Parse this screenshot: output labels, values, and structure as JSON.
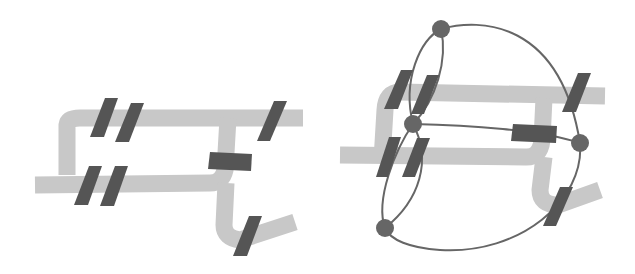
{
  "figure": {
    "panels": [
      {
        "id": "left",
        "description": "Road network with road segments (bridges/crossings) marked",
        "road_color": "#c8c8c8",
        "segment_color": "#555555",
        "roads": [
          "M67,175 L67,125 Q68,118 80,118 L303,118",
          "M35,185 L210,183 Q222,183 225,170 L228,118",
          "M226,183 L224,225 Q224,238 240,240 L295,222"
        ],
        "segments": [
          {
            "name": "seg-top-left-1",
            "points": "105,98 118,98 104,137 90,137"
          },
          {
            "name": "seg-top-left-2",
            "points": "131,103 144,103 129,142 115,142"
          },
          {
            "name": "seg-bot-left-1",
            "points": "89,166 102,166 88,205 74,205"
          },
          {
            "name": "seg-bot-left-2",
            "points": "115,166 128,166 114,206 100,206"
          },
          {
            "name": "seg-top-right",
            "points": "274,101 287,101 270,141 257,141"
          },
          {
            "name": "seg-middle",
            "points": "210,152 252,154 251,171 208,169"
          },
          {
            "name": "seg-bottom-right",
            "points": "249,216 262,216 247,256 233,256"
          }
        ]
      },
      {
        "id": "right",
        "description": "Same road network overlaid with a dual graph: nodes connected by edges through road segments",
        "road_color": "#c8c8c8",
        "segment_color": "#555555",
        "node_color": "#666666",
        "edge_color": "#666666",
        "roads": [
          "M382,160 L385,110 Q386,92 400,92 L605,96",
          "M340,155 L525,157 Q540,158 542,140 L544,98",
          "M544,157 L540,190 Q540,205 558,205 L600,190"
        ],
        "segments": [
          {
            "name": "seg-top-left-1",
            "points": "401,70 413,70 398,109 384,109"
          },
          {
            "name": "seg-top-left-2",
            "points": "427,75 439,75 424,114 411,114"
          },
          {
            "name": "seg-bot-left-1",
            "points": "389,137 401,137 388,177 376,177"
          },
          {
            "name": "seg-bot-left-2",
            "points": "417,138 430,138 415,177 402,177"
          },
          {
            "name": "seg-top-right",
            "points": "578,73 591,73 576,112 562,112"
          },
          {
            "name": "seg-middle",
            "points": "513,124 557,126 556,143 511,141"
          },
          {
            "name": "seg-bottom-right",
            "points": "560,187 573,187 556,226 543,226"
          }
        ],
        "nodes": [
          {
            "name": "node-top",
            "cx": 441,
            "cy": 29,
            "r": 9
          },
          {
            "name": "node-center-left",
            "cx": 413,
            "cy": 124,
            "r": 9
          },
          {
            "name": "node-right",
            "cx": 580,
            "cy": 143,
            "r": 9
          },
          {
            "name": "node-bottom",
            "cx": 385,
            "cy": 228,
            "r": 9
          }
        ],
        "edges": [
          "M441,29 C480,18 560,20 580,143",
          "M441,29 C420,40 402,80 413,124",
          "M441,29 C448,60 436,100 413,124",
          "M413,124 C395,150 375,200 385,228",
          "M413,124 C432,160 420,200 385,228",
          "M413,124 C470,125 540,130 580,143",
          "M580,143 C585,200 520,255 440,250 C410,248 390,240 385,228"
        ]
      }
    ]
  }
}
